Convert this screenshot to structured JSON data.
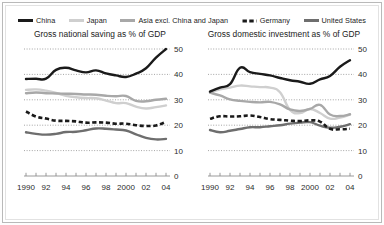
{
  "legend": {
    "items": [
      {
        "label": "China",
        "color": "#1a1a1a",
        "style": "solid",
        "width": 2.6,
        "icon": "line-swatch-icon"
      },
      {
        "label": "Japan",
        "color": "#cfcfcf",
        "style": "solid",
        "width": 2.6,
        "icon": "line-swatch-icon"
      },
      {
        "label": "Asia excl. China and Japan",
        "color": "#a8a8a8",
        "style": "solid",
        "width": 2.6,
        "icon": "line-swatch-icon"
      },
      {
        "label": "Germany",
        "color": "#1a1a1a",
        "style": "dashed",
        "width": 2.6,
        "icon": "dashed-line-swatch-icon"
      },
      {
        "label": "United States",
        "color": "#6e6e6e",
        "style": "solid",
        "width": 2.6,
        "icon": "line-swatch-icon"
      }
    ]
  },
  "chart_data": [
    {
      "type": "line",
      "title": "Gross national saving as % of GDP",
      "xlabel": "",
      "ylabel": "",
      "xlim": [
        1990,
        2004
      ],
      "ylim": [
        0,
        50
      ],
      "yticks": [
        0,
        10,
        20,
        30,
        40,
        50
      ],
      "xticks": [
        1990,
        1991,
        1992,
        1993,
        1994,
        1995,
        1996,
        1997,
        1998,
        1999,
        2000,
        2001,
        2002,
        2003,
        2004
      ],
      "xticklabels": [
        "1990",
        "",
        "92",
        "",
        "94",
        "",
        "96",
        "",
        "98",
        "",
        "2000",
        "",
        "02",
        "",
        "04"
      ],
      "grid": "horizontal-dotted",
      "legend_position": "top-shared",
      "x": [
        1990,
        1991,
        1992,
        1993,
        1994,
        1995,
        1996,
        1997,
        1998,
        1999,
        2000,
        2001,
        2002,
        2003,
        2004
      ],
      "series": [
        {
          "name": "China",
          "color": "#1a1a1a",
          "style": "solid",
          "values": [
            38.2,
            38.3,
            38.3,
            41.8,
            42.6,
            41.6,
            40.8,
            41.6,
            40.4,
            39.6,
            39.0,
            40.3,
            42.4,
            46.6,
            50.0
          ]
        },
        {
          "name": "Japan",
          "color": "#cfcfcf",
          "style": "solid",
          "values": [
            33.9,
            34.1,
            33.6,
            32.7,
            31.6,
            31.0,
            30.7,
            30.6,
            29.7,
            28.7,
            28.7,
            27.3,
            26.6,
            27.1,
            27.8
          ]
        },
        {
          "name": "Asia excl. China and Japan",
          "color": "#a8a8a8",
          "style": "solid",
          "values": [
            32.6,
            32.9,
            32.6,
            32.5,
            32.4,
            32.3,
            32.1,
            32.0,
            31.6,
            31.4,
            31.5,
            29.6,
            29.4,
            30.0,
            30.4
          ]
        },
        {
          "name": "Germany",
          "color": "#1a1a1a",
          "style": "dashed",
          "values": [
            25.4,
            23.4,
            22.6,
            21.8,
            21.7,
            21.5,
            21.0,
            21.1,
            21.0,
            20.6,
            20.6,
            20.0,
            19.7,
            19.9,
            21.3
          ]
        },
        {
          "name": "United States",
          "color": "#6e6e6e",
          "style": "solid",
          "values": [
            17.2,
            16.6,
            16.3,
            16.6,
            17.3,
            17.4,
            18.0,
            18.7,
            18.6,
            18.3,
            17.9,
            16.4,
            15.0,
            14.4,
            14.6
          ]
        }
      ]
    },
    {
      "type": "line",
      "title": "Gross domestic investment as % of GDP",
      "xlabel": "",
      "ylabel": "",
      "xlim": [
        1990,
        2004
      ],
      "ylim": [
        0,
        50
      ],
      "yticks": [
        0,
        10,
        20,
        30,
        40,
        50
      ],
      "xticks": [
        1990,
        1991,
        1992,
        1993,
        1994,
        1995,
        1996,
        1997,
        1998,
        1999,
        2000,
        2001,
        2002,
        2003,
        2004
      ],
      "xticklabels": [
        "1990",
        "",
        "92",
        "",
        "94",
        "",
        "96",
        "",
        "98",
        "",
        "2000",
        "",
        "02",
        "",
        "04"
      ],
      "grid": "horizontal-dotted",
      "legend_position": "top-shared",
      "x": [
        1990,
        1991,
        1992,
        1993,
        1994,
        1995,
        1996,
        1997,
        1998,
        1999,
        2000,
        2001,
        2002,
        2003,
        2004
      ],
      "series": [
        {
          "name": "China",
          "color": "#1a1a1a",
          "style": "solid",
          "values": [
            33.2,
            34.8,
            36.2,
            42.6,
            40.9,
            40.2,
            39.6,
            38.6,
            37.7,
            37.1,
            36.3,
            38.0,
            39.4,
            43.0,
            45.6
          ]
        },
        {
          "name": "Japan",
          "color": "#cfcfcf",
          "style": "solid",
          "values": [
            32.8,
            34.1,
            34.8,
            35.6,
            35.3,
            35.0,
            34.8,
            33.0,
            26.0,
            24.8,
            26.4,
            24.8,
            22.6,
            23.0,
            24.2
          ]
        },
        {
          "name": "Asia excl. China and Japan",
          "color": "#a8a8a8",
          "style": "solid",
          "values": [
            32.8,
            31.7,
            30.2,
            29.6,
            29.2,
            29.0,
            29.2,
            28.2,
            26.2,
            25.6,
            26.4,
            28.0,
            24.2,
            23.6,
            24.3
          ]
        },
        {
          "name": "Germany",
          "color": "#1a1a1a",
          "style": "dashed",
          "values": [
            22.5,
            23.5,
            23.4,
            23.5,
            23.8,
            23.2,
            22.4,
            22.1,
            21.8,
            21.6,
            21.9,
            21.4,
            18.6,
            18.4,
            18.6
          ]
        },
        {
          "name": "United States",
          "color": "#6e6e6e",
          "style": "solid",
          "values": [
            18.1,
            17.2,
            17.8,
            18.5,
            19.2,
            19.2,
            19.6,
            20.0,
            20.6,
            21.0,
            21.2,
            19.8,
            19.0,
            19.4,
            20.4
          ]
        }
      ]
    }
  ]
}
